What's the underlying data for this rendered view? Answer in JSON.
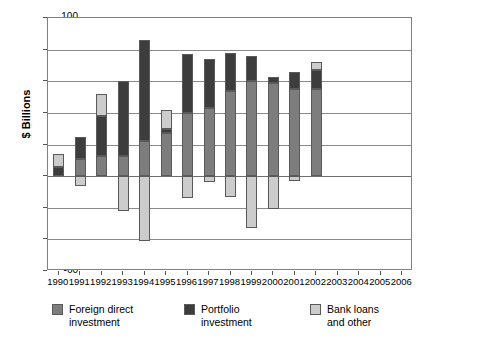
{
  "chart_data": {
    "type": "bar",
    "subtype": "stacked-bar-with-negatives",
    "title": "",
    "xlabel": "",
    "ylabel": "$ Billions",
    "ylim": [
      -60,
      100
    ],
    "ytick_values": [
      100,
      80,
      60,
      40,
      20,
      0,
      -20,
      -40,
      -60
    ],
    "ytick_labels": [
      "100",
      "80",
      "60",
      "40",
      "20",
      "0",
      "-20",
      "-40",
      "-60"
    ],
    "grid": true,
    "legend_position": "bottom-left",
    "categories": [
      "1990",
      "1991",
      "1992",
      "1993",
      "1994",
      "1995",
      "1996",
      "1997",
      "1998",
      "1999",
      "2000",
      "2001",
      "2002",
      "2003",
      "2004",
      "2005",
      "2006"
    ],
    "series": [
      {
        "name": "Foreign direct investment",
        "color": "#7d7d7d",
        "values": [
          0,
          11,
          13,
          13,
          22,
          27,
          40,
          43,
          54,
          60,
          59,
          55,
          55,
          null,
          null,
          null,
          null
        ]
      },
      {
        "name": "Portfolio investment",
        "color": "#3d3d3d",
        "values": [
          6,
          14,
          25,
          47,
          64,
          3,
          37,
          31,
          24,
          16,
          4,
          11,
          12,
          null,
          null,
          null,
          null
        ]
      },
      {
        "name": "Bank loans and other",
        "color": "#cccccc",
        "values": [
          8,
          -6,
          14,
          -22,
          -41,
          12,
          -14,
          -4,
          -13,
          -33,
          -21,
          -3,
          5,
          null,
          null,
          null,
          null
        ]
      }
    ],
    "bar_totals_positive": [
      14,
      25,
      52,
      60,
      86,
      42,
      77,
      74,
      78,
      76,
      63,
      66,
      72
    ],
    "bar_minimums_negative": [
      0,
      -6,
      0,
      -22,
      -41,
      0,
      -14,
      -4,
      -13,
      -33,
      -21,
      -3,
      0
    ]
  },
  "legend": [
    {
      "label_line1": "Foreign direct",
      "label_line2": "investment",
      "swatch": "fdi"
    },
    {
      "label_line1": "Portfolio",
      "label_line2": "investment",
      "swatch": "pf"
    },
    {
      "label_line1": "Bank loans",
      "label_line2": "and other",
      "swatch": "bl"
    }
  ]
}
